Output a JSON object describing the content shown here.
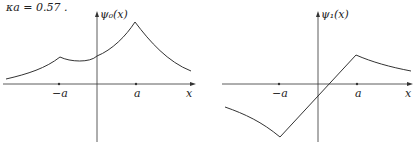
{
  "caption": "κa = 0.57 .",
  "plots": [
    {
      "ylabel": "ψ₀(x)",
      "xlabel": "x",
      "ticks": {
        "neg": "−a",
        "pos": "a"
      },
      "description": "even ground state, cusps at ±a, larger peak at +a"
    },
    {
      "ylabel": "ψ₁(x)",
      "xlabel": "x",
      "ticks": {
        "neg": "−a",
        "pos": "a"
      },
      "description": "odd-like excited state, linear between −a and a, decaying tails"
    }
  ]
}
